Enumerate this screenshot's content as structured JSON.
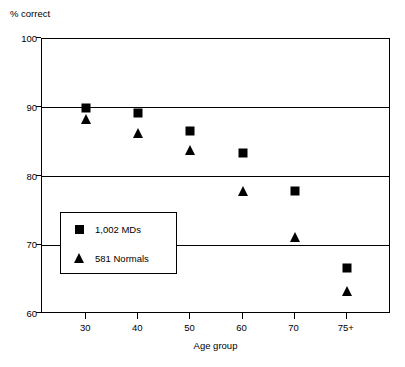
{
  "chart_data": {
    "type": "scatter",
    "title": "",
    "xlabel": "Age group",
    "ylabel": "% correct",
    "categories": [
      "30",
      "40",
      "50",
      "60",
      "70",
      "75+"
    ],
    "ylim": [
      60,
      100
    ],
    "yticks": [
      100,
      90,
      80,
      70,
      60
    ],
    "grid": "horizontal",
    "legend_position": "inside-lower-left",
    "series": [
      {
        "name": "1,002 MDs",
        "marker": "square",
        "color": "#000000",
        "values": [
          90.0,
          89.3,
          86.6,
          83.4,
          77.9,
          66.7
        ]
      },
      {
        "name": "581 Normals",
        "marker": "triangle",
        "color": "#000000",
        "values": [
          88.3,
          86.4,
          83.9,
          77.9,
          71.2,
          63.4
        ]
      }
    ]
  },
  "axes": {
    "y_axis_caption": "% correct",
    "x_axis_caption": "Age group",
    "y_tick_labels": [
      "100",
      "90",
      "80",
      "70",
      "60"
    ],
    "x_tick_labels": [
      "30",
      "40",
      "50",
      "60",
      "70",
      "75+"
    ]
  },
  "legend": {
    "entries": [
      {
        "label": "1,002 MDs",
        "marker": "square"
      },
      {
        "label": "581 Normals",
        "marker": "triangle"
      }
    ]
  }
}
